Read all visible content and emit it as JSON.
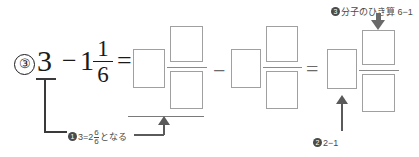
{
  "problem": {
    "number_label": "③",
    "whole_left": "3",
    "minus_sign": "−",
    "whole_sub": "1",
    "fraction_sub": {
      "numerator": "1",
      "denominator": "6"
    },
    "equals_sign": "="
  },
  "operators": {
    "minus_between_groups": "−",
    "equals_between_groups": "="
  },
  "answer_groups": [
    {
      "id": "group-1",
      "whole_box": "",
      "numerator_box": "",
      "denominator_box": "",
      "has_underline": true
    },
    {
      "id": "group-2",
      "whole_box": "",
      "numerator_box": "",
      "denominator_box": "",
      "has_underline": false
    },
    {
      "id": "group-3",
      "whole_box": "",
      "numerator_box": "",
      "denominator_box": "",
      "has_underline": false
    }
  ],
  "callouts": [
    {
      "id": "callout-1",
      "marker": "❶",
      "marker_number": "1",
      "text_before": "3=2",
      "fraction": {
        "numerator": "6",
        "denominator": "6"
      },
      "text_after": "となる",
      "full_text": "❶3=2 6/6 となる"
    },
    {
      "id": "callout-2",
      "marker": "❷",
      "marker_number": "2",
      "text": "2−1",
      "full_text": "❷2−1"
    },
    {
      "id": "callout-3",
      "marker": "❸",
      "marker_number": "3",
      "text": "分子のひき算 6−1",
      "full_text": "❸分子のひき算 6−1"
    }
  ],
  "colors": {
    "ink": "#1a1a1a",
    "box_border": "#a0a0a0",
    "annotation": "#4a4a4a",
    "leader": "#5a5a5a",
    "arrow_gray": "#6a6a6a",
    "rule": "#8a8a8a"
  }
}
